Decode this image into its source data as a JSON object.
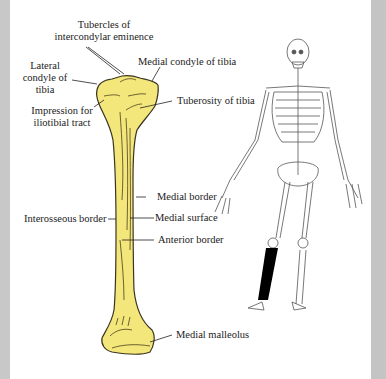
{
  "figure": {
    "title": "Tibia",
    "colors": {
      "bone_fill": "#f3e67a",
      "bone_outline": "#3a3420",
      "highlighted_bone": "#000000",
      "frame_gray": "#c6c6c6"
    },
    "labels": {
      "tubercles_line1": "Tubercles  of",
      "tubercles_line2": "intercondylar eminence",
      "lateral_line1": "Lateral",
      "lateral_line2": "condyle of",
      "lateral_line3": "tibia",
      "medial_condyle": "Medial condyle of tibia",
      "tuberosity": "Tuberosity of tibia",
      "impression_line1": "Impression for",
      "impression_line2": "iliotibial tract",
      "medial_border": "Medial border",
      "interosseous_border": "Interosseous border",
      "medial_surface": "Medial surface",
      "anterior_border": "Anterior border",
      "medial_malleolus": "Medial malleolus"
    },
    "inset": {
      "description": "Full skeleton with right tibia highlighted in black"
    }
  }
}
